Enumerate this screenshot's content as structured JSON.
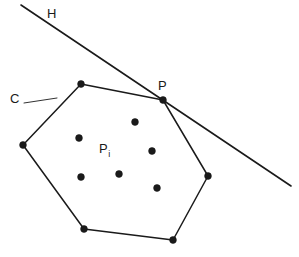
{
  "figure": {
    "kind": "geometry-diagram",
    "background_color": "#ffffff",
    "stroke_color": "#1a1a1a"
  },
  "labels": {
    "hyperplane": "H",
    "hull": "C",
    "tangent_point": "P",
    "point_set_base": "P",
    "point_set_subscript": "i"
  },
  "geometry": {
    "hull_polygon": {
      "name": "C",
      "closed": true,
      "vertices": [
        {
          "name": "top",
          "x": 81,
          "y": 84
        },
        {
          "name": "tangent-P",
          "x": 163,
          "y": 100
        },
        {
          "name": "right",
          "x": 208,
          "y": 176
        },
        {
          "name": "bottom-right",
          "x": 173,
          "y": 240
        },
        {
          "name": "bottom-left",
          "x": 84,
          "y": 229
        },
        {
          "name": "left",
          "x": 23,
          "y": 145
        }
      ],
      "vertex_marker": {
        "shape": "filled-circle",
        "radius": 3.4,
        "fill": "#1a1a1a"
      }
    },
    "hyperplane_line": {
      "name": "H",
      "x1": 21,
      "y1": 5,
      "x2": 291,
      "y2": 186
    },
    "leader_line": {
      "name": "C-leader",
      "x1": 24,
      "y1": 103,
      "x2": 57,
      "y2": 98
    },
    "interior_points": [
      {
        "x": 135,
        "y": 122
      },
      {
        "x": 79,
        "y": 138
      },
      {
        "x": 152,
        "y": 151
      },
      {
        "x": 119,
        "y": 174
      },
      {
        "x": 81,
        "y": 177
      },
      {
        "x": 157,
        "y": 188
      }
    ],
    "interior_point_marker": {
      "shape": "filled-circle",
      "radius": 3.4,
      "fill": "#1a1a1a"
    }
  }
}
